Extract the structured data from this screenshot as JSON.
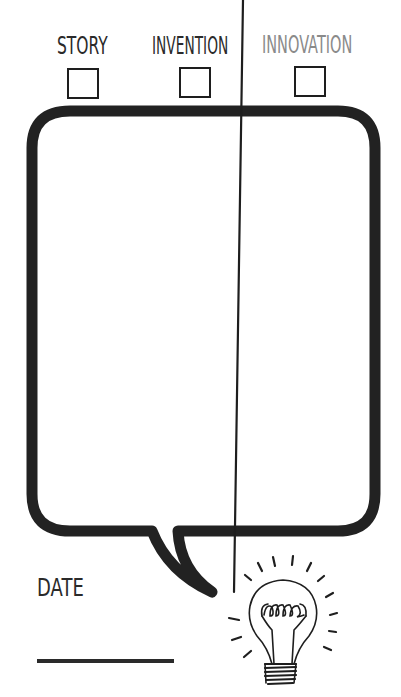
{
  "categories": [
    {
      "id": "story",
      "label": "STORY",
      "checked": false,
      "color": "#2a2a2a"
    },
    {
      "id": "invention",
      "label": "INVENTION",
      "checked": false,
      "color": "#2a2a2a"
    },
    {
      "id": "innovation",
      "label": "INNOVATION",
      "checked": false,
      "color": "#8a8a8a"
    }
  ],
  "speech_bubble": {
    "content": "",
    "stroke_color": "#222222"
  },
  "date": {
    "label": "DATE",
    "value": ""
  },
  "decoration": {
    "icon": "lightbulb-icon"
  }
}
